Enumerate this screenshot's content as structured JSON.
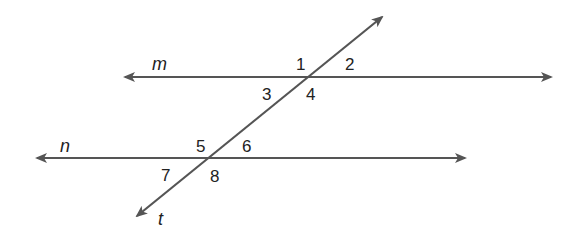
{
  "diagram": {
    "type": "parallel-lines-cut-by-transversal",
    "line_color": "#555555",
    "lines": [
      {
        "name": "m",
        "label": "m"
      },
      {
        "name": "n",
        "label": "n"
      },
      {
        "name": "t",
        "label": "t"
      }
    ],
    "angles": [
      {
        "id": "1",
        "label": "1"
      },
      {
        "id": "2",
        "label": "2"
      },
      {
        "id": "3",
        "label": "3"
      },
      {
        "id": "4",
        "label": "4"
      },
      {
        "id": "5",
        "label": "5"
      },
      {
        "id": "6",
        "label": "6"
      },
      {
        "id": "7",
        "label": "7"
      },
      {
        "id": "8",
        "label": "8"
      }
    ]
  }
}
